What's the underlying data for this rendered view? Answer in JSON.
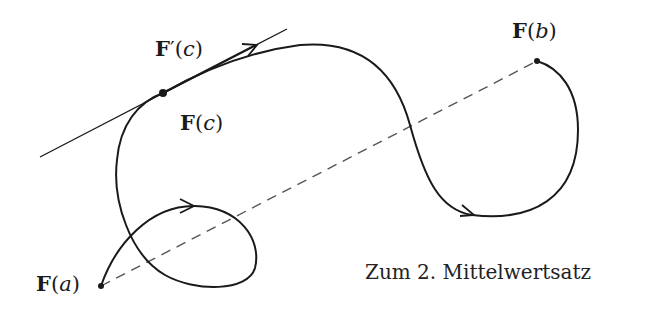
{
  "figure": {
    "caption": "Zum 2. Mittelwertsatz",
    "labels": {
      "Fa": {
        "bold": "F",
        "arg": "a",
        "text": "F(a)"
      },
      "Fb": {
        "bold": "F",
        "arg": "b",
        "text": "F(b)"
      },
      "Fc": {
        "bold": "F",
        "arg": "c",
        "text": "F(c)"
      },
      "Fpc": {
        "bold": "F",
        "prime": "′",
        "arg": "c",
        "text": "F′(c)"
      }
    },
    "elements": [
      {
        "name": "curve",
        "style": "solid",
        "from": "F(a)",
        "to": "F(b)",
        "arrows": 3
      },
      {
        "name": "tangent-line",
        "style": "solid",
        "through": "F(c)"
      },
      {
        "name": "tangent-vector",
        "label": "F′(c)"
      },
      {
        "name": "chord",
        "style": "dashed",
        "from": "F(a)",
        "to": "F(b)"
      }
    ],
    "colors": {
      "stroke": "#1a1a1a",
      "dash": "#555555",
      "background": "#ffffff"
    }
  }
}
